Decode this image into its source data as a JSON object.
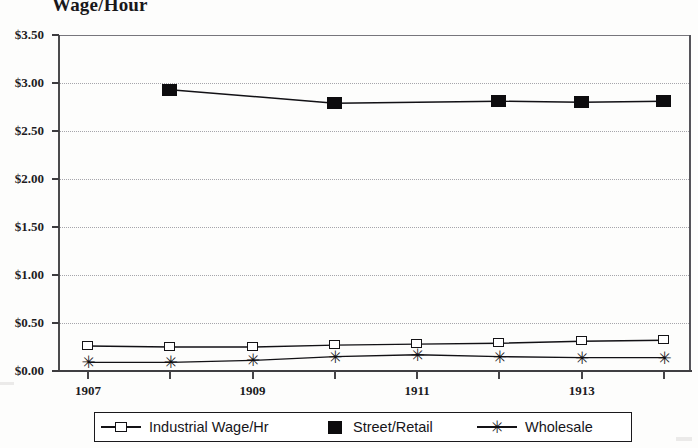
{
  "chart_data": {
    "type": "line",
    "title": "Wage/Hour",
    "xlabel": "",
    "ylabel": "",
    "x": [
      1907,
      1908,
      1909,
      1910,
      1911,
      1912,
      1913,
      1914
    ],
    "x_tick_labels": [
      "1907",
      "",
      "1909",
      "",
      "1911",
      "",
      "1913",
      ""
    ],
    "y_tick_labels": [
      "$0.00",
      "$0.50",
      "$1.00",
      "$1.50",
      "$2.00",
      "$2.50",
      "$3.00",
      "$3.50"
    ],
    "y_tick_values": [
      0.0,
      0.5,
      1.0,
      1.5,
      2.0,
      2.5,
      3.0,
      3.5
    ],
    "ylim": [
      0.0,
      3.5
    ],
    "xlim": [
      1907,
      1914
    ],
    "grid": true,
    "legend_position": "bottom",
    "series": [
      {
        "name": "Industrial Wage/Hr",
        "marker": "open-square",
        "values": [
          0.26,
          0.25,
          0.25,
          0.27,
          0.28,
          0.29,
          0.31,
          0.32
        ]
      },
      {
        "name": "Street/Retail",
        "marker": "filled-square",
        "values": [
          null,
          2.93,
          null,
          2.79,
          null,
          2.81,
          2.8,
          2.81
        ]
      },
      {
        "name": "Wholesale",
        "marker": "star",
        "values": [
          0.09,
          0.09,
          0.11,
          0.15,
          0.17,
          0.15,
          0.14,
          0.14
        ]
      }
    ]
  },
  "colors": {
    "ink": "#121115",
    "grid": "#a6a5ab",
    "background": "#fdfdfc"
  }
}
